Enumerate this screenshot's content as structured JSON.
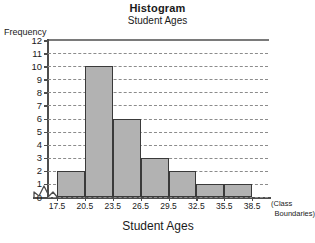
{
  "chart_data": {
    "type": "bar",
    "title": "Histogram",
    "subtitle": "Student Ages",
    "xlabel": "Student Ages",
    "ylabel": "Frequency",
    "x_axis_note_line1": "(Class",
    "x_axis_note_line2": "Boundaries)",
    "categories": [
      "17.5-20.5",
      "20.5-23.5",
      "23.5-26.5",
      "26.5-29.5",
      "29.5-32.5",
      "32.5-35.5",
      "35.5-38.5"
    ],
    "values": [
      2,
      10,
      6,
      3,
      2,
      1,
      1
    ],
    "class_boundaries": [
      17.5,
      20.5,
      23.5,
      26.5,
      29.5,
      32.5,
      35.5,
      38.5
    ],
    "boundary_labels": [
      "17.5",
      "20.5",
      "23.5",
      "26.5",
      "29.5",
      "32.5",
      "35.5",
      "38.5"
    ],
    "ylim": [
      0,
      12
    ],
    "yticks": [
      0,
      1,
      2,
      3,
      4,
      5,
      6,
      7,
      8,
      9,
      10,
      11,
      12
    ],
    "ytick_labels": [
      "0",
      "1",
      "2",
      "3",
      "4",
      "5",
      "6",
      "7",
      "8",
      "9",
      "10",
      "11",
      "12"
    ],
    "grid": true,
    "grid_style": "dashed",
    "grid_axis": "y",
    "legend": false,
    "axis_break": true,
    "bar_fill_color": "#b2b2b2",
    "bar_edge_color": "#3a3a3a",
    "grid_color": "#8c8c8c",
    "axis_color": "#4d4d4d",
    "background_color": "#ffffff"
  }
}
